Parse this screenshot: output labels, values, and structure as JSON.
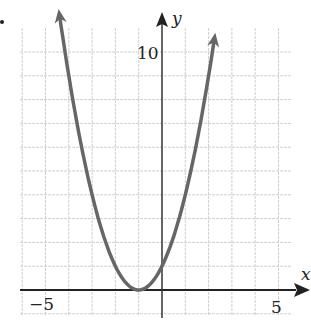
{
  "chart_data": {
    "type": "line",
    "title": "",
    "function": "y = (x + 1)^2",
    "xlabel": "x",
    "ylabel": "y",
    "xlim": [
      -6,
      6
    ],
    "ylim": [
      -1,
      11
    ],
    "grid": true,
    "grid_step": 1,
    "x_tick_labels": [
      {
        "value": -5,
        "label": "−5"
      },
      {
        "value": 5,
        "label": "5"
      }
    ],
    "y_tick_labels": [
      {
        "value": 10,
        "label": "10"
      }
    ],
    "series": [
      {
        "name": "parabola",
        "color": "#666666",
        "x": [
          -4.4,
          -4,
          -3.5,
          -3,
          -2.5,
          -2,
          -1.5,
          -1,
          -0.5,
          0,
          0.5,
          1,
          1.5,
          2,
          2.25
        ],
        "y": [
          11.56,
          9,
          6.25,
          4,
          2.25,
          1,
          0.25,
          0,
          0.25,
          1,
          2.25,
          4,
          6.25,
          9,
          10.56
        ],
        "vertex": [
          -1,
          0
        ],
        "y_intercept": 1,
        "arrows_at_ends": true
      }
    ]
  },
  "labels": {
    "x_axis": "x",
    "y_axis": "y",
    "x_neg": "−5",
    "x_pos": "5",
    "y_top": "10",
    "marker": "•"
  }
}
